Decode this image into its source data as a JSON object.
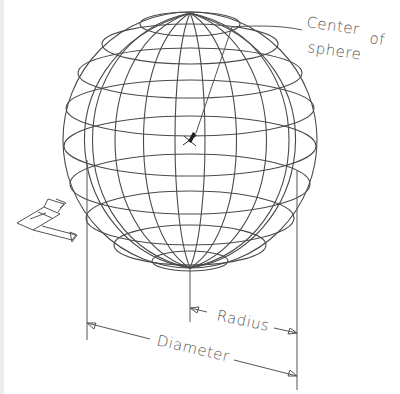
{
  "diagram": {
    "labels": {
      "center_line1": "Center",
      "center_line2": "of",
      "center_line3": "sphere",
      "radius": "Radius",
      "diameter": "Diameter"
    },
    "icons": {
      "ucs": "ucs-axis-icon"
    },
    "colors": {
      "line": "#4a4a4a",
      "background": "#ffffff"
    }
  }
}
